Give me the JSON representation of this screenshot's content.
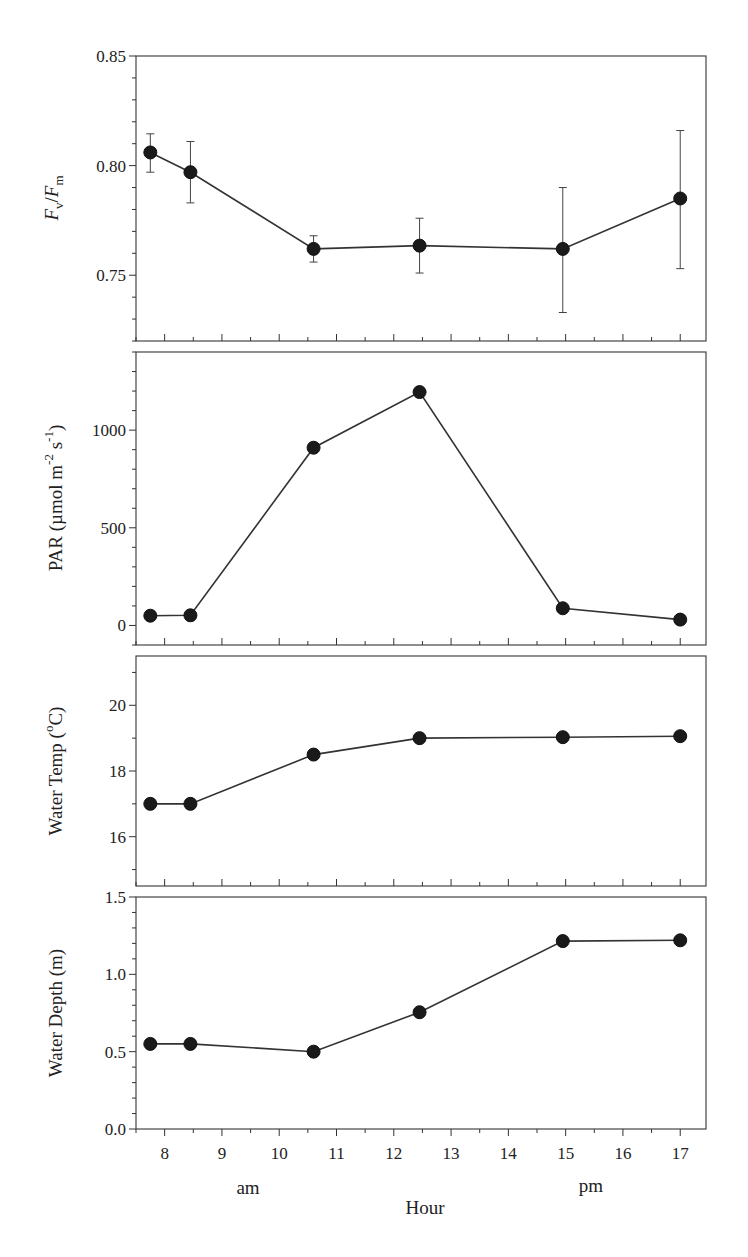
{
  "chart_data": [
    {
      "type": "line",
      "panel": "top",
      "ylabel": "Fv/Fm",
      "ylabel_parts": {
        "main1": "F",
        "sub1": "v",
        "slash": "/",
        "main2": "F",
        "sub2": "m"
      },
      "ylim": [
        0.72,
        0.85
      ],
      "yticks": [
        0.75,
        0.8,
        0.85
      ],
      "ytick_labels": [
        "0.75",
        "0.80",
        "0.85"
      ],
      "yminor_step": 0.01,
      "x": [
        7.75,
        8.45,
        10.6,
        12.45,
        14.95,
        17.0
      ],
      "values": [
        0.806,
        0.797,
        0.762,
        0.7635,
        0.762,
        0.785
      ],
      "err_upper": [
        0.8145,
        0.811,
        0.768,
        0.776,
        0.79,
        0.816
      ],
      "err_lower": [
        0.797,
        0.783,
        0.756,
        0.751,
        0.733,
        0.753
      ],
      "grid": false
    },
    {
      "type": "line",
      "panel": "par",
      "ylabel": "PAR (µmol m-2 s-1)",
      "ylabel_parts": {
        "prefix": "PAR (µmol m",
        "sup1": "-2",
        "mid": " s",
        "sup2": "-1",
        "suffix": ")"
      },
      "ylim": [
        -100,
        1400
      ],
      "yticks": [
        0,
        500,
        1000
      ],
      "ytick_labels": [
        "0",
        "500",
        "1000"
      ],
      "yminor_step": 100,
      "x": [
        7.75,
        8.45,
        10.6,
        12.45,
        14.95,
        17.0
      ],
      "values": [
        50,
        52,
        910,
        1195,
        88,
        30
      ],
      "grid": false
    },
    {
      "type": "line",
      "panel": "temp",
      "ylabel": "Water Temp (°C)",
      "ylabel_parts": {
        "prefix": "Water Temp (",
        "sup1": "o",
        "suffix": "C)"
      },
      "ylim": [
        14.5,
        21.5
      ],
      "yticks": [
        16,
        18,
        20
      ],
      "ytick_labels": [
        "16",
        "18",
        "20"
      ],
      "yminor_step": 1,
      "x": [
        7.75,
        8.45,
        10.6,
        12.45,
        14.95,
        17.0
      ],
      "values": [
        17.0,
        17.0,
        18.5,
        19.0,
        19.03,
        19.06
      ],
      "grid": false
    },
    {
      "type": "line",
      "panel": "depth",
      "ylabel": "Water Depth (m)",
      "ylim": [
        0.0,
        1.5
      ],
      "yticks": [
        0.0,
        0.5,
        1.0,
        1.5
      ],
      "ytick_labels": [
        "0.0",
        "0.5",
        "1.0",
        "1.5"
      ],
      "yminor_step": 0.1,
      "x": [
        7.75,
        8.45,
        10.6,
        12.45,
        14.95,
        17.0
      ],
      "values": [
        0.55,
        0.55,
        0.5,
        0.755,
        1.215,
        1.22
      ],
      "grid": false
    }
  ],
  "x_axis": {
    "xlim": [
      7.5,
      17.45
    ],
    "xticks": [
      8,
      9,
      10,
      11,
      12,
      13,
      14,
      15,
      16,
      17
    ],
    "xtick_labels": [
      "8",
      "9",
      "10",
      "11",
      "12",
      "13",
      "14",
      "15",
      "16",
      "17"
    ],
    "xminor_step": 0.5,
    "xlabel": "Hour",
    "am_label": "am",
    "pm_label": "pm"
  },
  "colors": {
    "line": "#333333",
    "marker": "#1a1a1a",
    "background": "#ffffff"
  }
}
